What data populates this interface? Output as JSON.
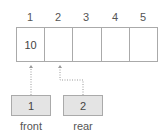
{
  "queue": {
    "indices": [
      "1",
      "2",
      "3",
      "4",
      "5"
    ],
    "cells": [
      "10",
      "",
      "",
      "",
      ""
    ]
  },
  "pointers": {
    "front": {
      "value": "1",
      "label": "front"
    },
    "rear": {
      "value": "2",
      "label": "rear"
    }
  },
  "colors": {
    "border": "#aaaaaa",
    "pointer_fill": "#e4e4e4",
    "arrow": "#999999"
  }
}
